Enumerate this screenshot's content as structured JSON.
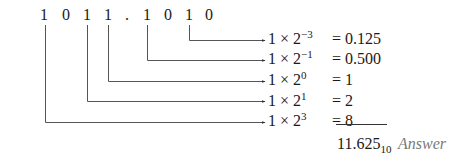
{
  "binary_number": {
    "digits": [
      "1",
      "0",
      "1",
      "1",
      ".",
      "1",
      "0",
      "1",
      "0"
    ]
  },
  "terms": [
    {
      "coef": "1",
      "times": "×",
      "base": "2",
      "exp": "−3",
      "equals": "=",
      "value": "0.125"
    },
    {
      "coef": "1",
      "times": "×",
      "base": "2",
      "exp": "−1",
      "equals": "=",
      "value": "0.500"
    },
    {
      "coef": "1",
      "times": "×",
      "base": "2",
      "exp": "0",
      "equals": "=",
      "value": "1"
    },
    {
      "coef": "1",
      "times": "×",
      "base": "2",
      "exp": "1",
      "equals": "=",
      "value": "2"
    },
    {
      "coef": "1",
      "times": "×",
      "base": "2",
      "exp": "3",
      "equals": "=",
      "value": "8"
    }
  ],
  "result": {
    "value": "11.625",
    "base_subscript": "10",
    "label": "Answer"
  },
  "colors": {
    "ink": "#1a1a1a",
    "line": "#555555",
    "answer_label": "#7a7a7a"
  }
}
